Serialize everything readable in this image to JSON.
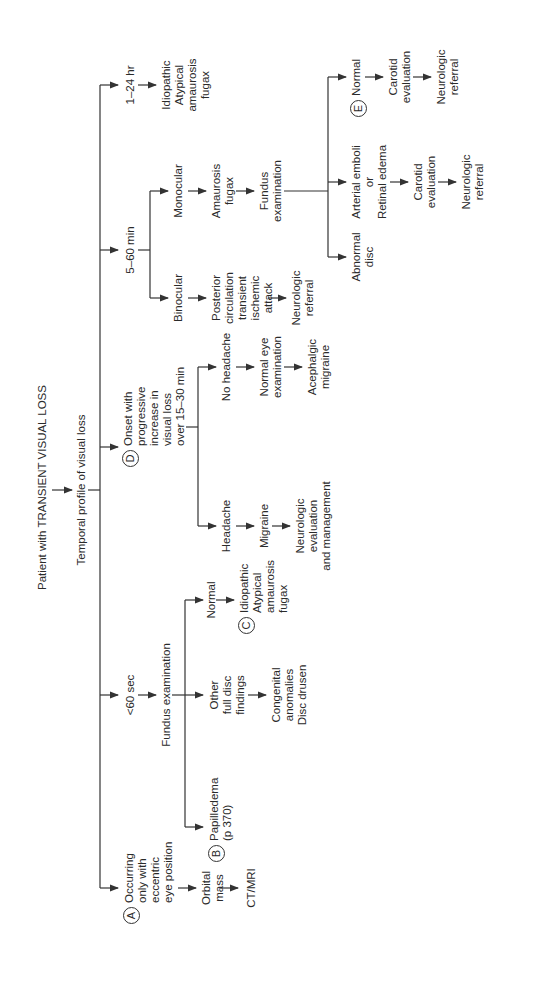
{
  "title": "Patient with TRANSIENT VISUAL LOSS",
  "root_step": "Temporal profile of visual loss",
  "branches": {
    "a": {
      "badge": "A",
      "label": "Occurring\nonly with\neccentric\neye position",
      "step1": "Orbital\nmass",
      "step2": "CT/MRI"
    },
    "lt60": {
      "label": "<60 sec",
      "step1": "Fundus examination",
      "papilledema": {
        "badge": "B",
        "label": "Papilledema\n(p 370)"
      },
      "other": {
        "label": "Other\nfull disc\nfindings",
        "result": "Congenital\nanomalies\nDisc drusen"
      },
      "normal": {
        "label": "Normal",
        "badge": "C",
        "result": "Idiopathic\nAtypical\namaurosis\nfugax"
      }
    },
    "d": {
      "badge": "D",
      "label": "Onset with\nprogressive\nincrease in\nvisual loss\nover 15–30 min",
      "headache": {
        "label": "Headache",
        "step1": "Migraine",
        "step2": "Neurologic\nevaluation\nand management"
      },
      "no_headache": {
        "label": "No headache",
        "step1": "Normal eye\nexamination",
        "step2": "Acephalgic\nmigraine"
      }
    },
    "min5_60": {
      "label": "5–60 min",
      "binocular": {
        "label": "Binocular",
        "step1": "Posterior\ncirculation\ntransient\nischemic\nattack",
        "step2": "Neurologic\nreferral"
      },
      "monocular": {
        "label": "Monocular",
        "step1": "Amaurosis\nfugax",
        "step2": "Fundus\nexamination",
        "abnormal": "Abnormal\ndisc",
        "emboli": {
          "label": "Arterial emboli\nor\nRetinal edema",
          "step1": "Carotid\nevaluation",
          "step2": "Neurologic\nreferral"
        },
        "normal": {
          "badge": "E",
          "label": "Normal",
          "step1": "Carotid\nevaluation",
          "step2": "Neurologic\nreferral"
        }
      }
    },
    "hr1_24": {
      "label": "1–24 hr",
      "result": "Idiopathic\nAtypical\namaurosis\nfugax"
    }
  }
}
